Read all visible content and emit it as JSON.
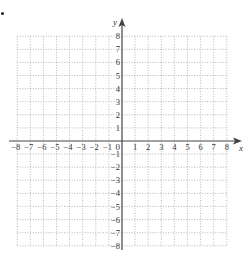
{
  "figure": {
    "type": "coordinate-grid",
    "x_axis": {
      "label": "x",
      "min": -8,
      "max": 8,
      "tick_labels": [
        "-8",
        "-7",
        "-6",
        "-5",
        "-4",
        "-3",
        "-2",
        "-1",
        "1",
        "2",
        "3",
        "4",
        "5",
        "6",
        "7",
        "8"
      ]
    },
    "y_axis": {
      "label": "y",
      "min": -8,
      "max": 8,
      "tick_labels": [
        "8",
        "7",
        "6",
        "5",
        "4",
        "3",
        "2",
        "1",
        "-1",
        "-2",
        "-3",
        "-4",
        "-5",
        "-6",
        "-7",
        "-8"
      ]
    },
    "origin_label": "0",
    "grid": {
      "style": "dotted",
      "step": 1
    },
    "colors": {
      "axis": "#444444",
      "grid": "#9a9a9a",
      "text": "#333333"
    }
  },
  "list_marker": "bullet"
}
